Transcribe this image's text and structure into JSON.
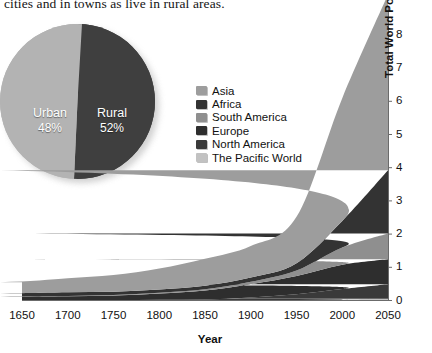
{
  "body_text": "cities and in towns as live in rural areas.",
  "pie": {
    "title": "",
    "slices": [
      {
        "label": "Urban",
        "pct": "48%",
        "value": 48,
        "color": "#b3b3b3"
      },
      {
        "label": "Rural",
        "pct": "52%",
        "value": 52,
        "color": "#3f3f3f"
      }
    ]
  },
  "legend": {
    "items": [
      {
        "label": "Asia",
        "color": "#9d9d9d"
      },
      {
        "label": "Africa",
        "color": "#333333"
      },
      {
        "label": "South America",
        "color": "#8f8f8f"
      },
      {
        "label": "Europe",
        "color": "#2e2e2e"
      },
      {
        "label": "North America",
        "color": "#3a3a3a"
      },
      {
        "label": "The Pacific World",
        "color": "#c2c2c2"
      }
    ]
  },
  "axes": {
    "x_title": "Year",
    "y_title_bold": "Total World Population",
    "y_title_plain": " (in billions)",
    "x_ticks": [
      "1650",
      "1700",
      "1750",
      "1800",
      "1850",
      "1900",
      "1950",
      "2000",
      "2050"
    ],
    "y_ticks": [
      "8",
      "7",
      "6",
      "5",
      "4",
      "3",
      "2",
      "1",
      "0"
    ]
  },
  "chart_data": {
    "type": "area",
    "title": "Total World Population (in billions)",
    "xlabel": "Year",
    "ylabel": "Total World Population (in billions)",
    "xlim": [
      1650,
      2050
    ],
    "ylim": [
      0,
      8.6
    ],
    "grid": false,
    "stacked": true,
    "legend_position": "center-left",
    "x": [
      1650,
      1700,
      1750,
      1800,
      1850,
      1900,
      1950,
      2000,
      2050
    ],
    "series": [
      {
        "name": "The Pacific World",
        "color": "#c2c2c2",
        "values": [
          0.003,
          0.003,
          0.003,
          0.003,
          0.004,
          0.006,
          0.013,
          0.031,
          0.05
        ]
      },
      {
        "name": "North America",
        "color": "#3a3a3a",
        "values": [
          0.005,
          0.005,
          0.006,
          0.016,
          0.026,
          0.082,
          0.172,
          0.314,
          0.44
        ]
      },
      {
        "name": "Europe",
        "color": "#2e2e2e",
        "values": [
          0.1,
          0.12,
          0.14,
          0.19,
          0.27,
          0.4,
          0.55,
          0.73,
          0.75
        ]
      },
      {
        "name": "South America",
        "color": "#8f8f8f",
        "values": [
          0.012,
          0.01,
          0.016,
          0.024,
          0.038,
          0.074,
          0.167,
          0.52,
          0.78
        ]
      },
      {
        "name": "Africa",
        "color": "#333333",
        "values": [
          0.1,
          0.11,
          0.1,
          0.1,
          0.11,
          0.13,
          0.22,
          0.8,
          1.9
        ]
      },
      {
        "name": "Asia",
        "color": "#9d9d9d",
        "values": [
          0.33,
          0.42,
          0.5,
          0.63,
          0.81,
          0.95,
          1.4,
          3.7,
          5.3
        ]
      }
    ],
    "totals": [
      0.55,
      0.67,
      0.77,
      0.96,
      1.26,
      1.64,
      2.52,
      6.1,
      9.2
    ],
    "pie": {
      "type": "pie",
      "labels": [
        "Urban",
        "Rural"
      ],
      "values": [
        48,
        52
      ]
    }
  }
}
